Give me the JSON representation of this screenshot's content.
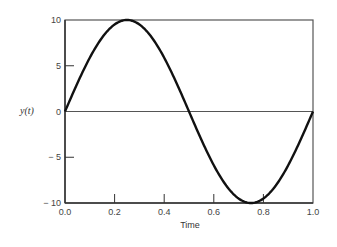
{
  "chart_data": {
    "type": "line",
    "title": "",
    "xlabel": "Time",
    "ylabel": "y(t)",
    "xlim": [
      0.0,
      1.0
    ],
    "ylim": [
      -10,
      10
    ],
    "x_ticks": [
      "0.0",
      "0.2",
      "0.4",
      "0.6",
      "0.8",
      "1.0"
    ],
    "y_ticks": [
      "10",
      "5",
      "0",
      "− 5",
      "− 10"
    ],
    "grid": false,
    "zero_line": true,
    "series": [
      {
        "name": "y(t) = 10 sin(2πt)",
        "x": [
          0.0,
          0.05,
          0.1,
          0.15,
          0.2,
          0.25,
          0.3,
          0.35,
          0.4,
          0.45,
          0.5,
          0.55,
          0.6,
          0.65,
          0.7,
          0.75,
          0.8,
          0.85,
          0.9,
          0.95,
          1.0
        ],
        "y": [
          0,
          3.09,
          5.88,
          8.09,
          9.51,
          10,
          9.51,
          8.09,
          5.88,
          3.09,
          0,
          -3.09,
          -5.88,
          -8.09,
          -9.51,
          -10,
          -9.51,
          -8.09,
          -5.88,
          -3.09,
          0
        ]
      }
    ]
  }
}
